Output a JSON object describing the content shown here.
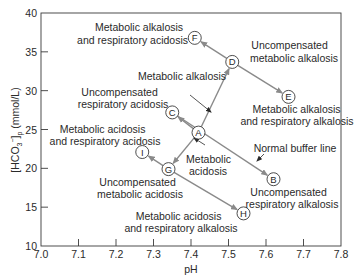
{
  "chart_data": {
    "type": "scatter",
    "title": "",
    "xlabel": "pH",
    "ylabel": "[HCO3−]p (mmol/L)",
    "ylabel_parts": {
      "main": "[HCO",
      "sub": "3",
      "sup": "−",
      "close": "]",
      "sub2": "p",
      "unit": " (mmol/L)"
    },
    "xlim": [
      7.0,
      7.8
    ],
    "ylim": [
      10,
      40
    ],
    "x_ticks": [
      "7.0",
      "7.1",
      "7.2",
      "7.3",
      "7.4",
      "7.5",
      "7.6",
      "7.7",
      "7.8"
    ],
    "y_ticks": [
      "10",
      "15",
      "20",
      "25",
      "30",
      "35",
      "40"
    ],
    "grid": false,
    "legend": null,
    "points": [
      {
        "id": "A",
        "pH": 7.42,
        "hco3": 24.6
      },
      {
        "id": "B",
        "pH": 7.62,
        "hco3": 18.6
      },
      {
        "id": "C",
        "pH": 7.35,
        "hco3": 27.2
      },
      {
        "id": "D",
        "pH": 7.51,
        "hco3": 33.7
      },
      {
        "id": "E",
        "pH": 7.66,
        "hco3": 29.2
      },
      {
        "id": "F",
        "pH": 7.41,
        "hco3": 36.8
      },
      {
        "id": "G",
        "pH": 7.34,
        "hco3": 19.9
      },
      {
        "id": "H",
        "pH": 7.54,
        "hco3": 14.2
      },
      {
        "id": "I",
        "pH": 7.27,
        "hco3": 22.1
      }
    ],
    "arrows": [
      {
        "from": "A",
        "to": "C"
      },
      {
        "from": "A",
        "to": "D"
      },
      {
        "from": "A",
        "to": "G"
      },
      {
        "from": "D",
        "to": "F"
      },
      {
        "from": "D",
        "to": "E"
      },
      {
        "from": "G",
        "to": "I"
      },
      {
        "from": "G",
        "to": "H"
      },
      {
        "line": "normal-buffer-line",
        "from": "C",
        "to": "B"
      }
    ],
    "annotations": {
      "F": [
        "Metabolic alkalosis",
        "and respiratory acidosis"
      ],
      "D": [
        "Uncompensated",
        "metabolic alkalosis"
      ],
      "metabolic_alkalosis": [
        "Metabolic alkalosis"
      ],
      "C": [
        "Uncompensated",
        "respiratory acidosis"
      ],
      "E": [
        "Metabolic alkalosis",
        "and respiratory alkalosis"
      ],
      "I": [
        "Metabolic acidosis",
        "and respiratory acidosis"
      ],
      "metabolic_acidosis": [
        "Metabolic",
        "acidosis"
      ],
      "buffer_line": [
        "Normal buffer line"
      ],
      "B": [
        "Uncompensated",
        "respiratory alkalosis"
      ],
      "G": [
        "Uncompensated",
        "metabolic acidosis"
      ],
      "H": [
        "Metabolic acidosis",
        "and respiratory alkalosis"
      ]
    }
  }
}
